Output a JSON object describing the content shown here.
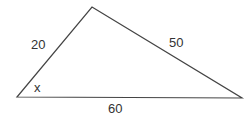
{
  "diagram": {
    "type": "triangle",
    "vertices": {
      "left": [
        17,
        97
      ],
      "top": [
        92,
        7
      ],
      "right": [
        242,
        98
      ]
    },
    "line_color": "#444444",
    "labels": {
      "side_left": "20",
      "side_right": "50",
      "side_bottom": "60",
      "angle_left": "x"
    }
  }
}
